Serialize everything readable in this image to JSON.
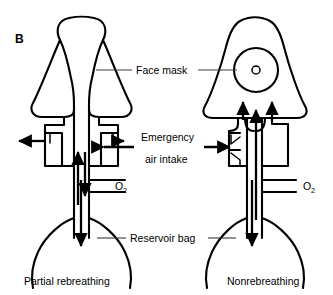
{
  "figure": {
    "panel_label": "B",
    "background_color": "#ffffff",
    "line_color": "#000000",
    "leader_color": "#3a3a3a"
  },
  "labels": {
    "face_mask": "Face mask",
    "emergency_line1": "Emergency",
    "emergency_line2": "air intake",
    "reservoir_bag": "Reservoir bag",
    "oxygen_left": "O",
    "oxygen_left_sub": "2",
    "oxygen_right": "O",
    "oxygen_right_sub": "2"
  },
  "captions": {
    "left": "Partial rebreathing",
    "right": "Nonrebreathing"
  },
  "devices": [
    {
      "id": "partial-rebreathing",
      "name": "Partial rebreathing mask",
      "caption": "Partial rebreathing",
      "side": "left",
      "mask_shape": "rounded-dome-triangle",
      "has_exhalation_port": true,
      "has_one_way_valve": false,
      "mask_vent_circle": false,
      "flow_arrows": [
        "exhale-left-out",
        "exhale-right-out",
        "air-intake-in",
        "bidirectional-bag-flow"
      ]
    },
    {
      "id": "nonrebreathing",
      "name": "Nonrebreathing mask",
      "caption": "Nonrebreathing",
      "side": "right",
      "mask_shape": "rounded-triangle",
      "has_exhalation_port": true,
      "has_one_way_valve": true,
      "mask_vent_circle": true,
      "flow_arrows": [
        "inhale-up-into-mask-left",
        "inhale-up-into-mask-right",
        "air-intake-in",
        "bag-up-flow",
        "bag-down-flow"
      ]
    }
  ]
}
